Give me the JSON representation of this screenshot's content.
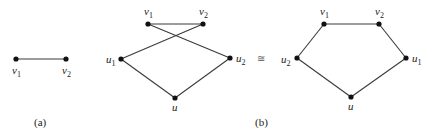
{
  "panels": [
    {
      "caption": "(a)",
      "nodes": [
        {
          "id": "v1",
          "base": "v",
          "sub": "1"
        },
        {
          "id": "v2",
          "base": "v",
          "sub": "2"
        }
      ],
      "edges": [
        [
          "v1",
          "v2"
        ]
      ]
    },
    {
      "caption": "(b)",
      "left_graph": {
        "nodes": [
          {
            "id": "v1",
            "base": "v",
            "sub": "1"
          },
          {
            "id": "v2",
            "base": "v",
            "sub": "2"
          },
          {
            "id": "u1",
            "base": "u",
            "sub": "1"
          },
          {
            "id": "u2",
            "base": "u",
            "sub": "2"
          },
          {
            "id": "u",
            "base": "u",
            "sub": ""
          }
        ],
        "edges": [
          [
            "v1",
            "v2"
          ],
          [
            "v1",
            "u2"
          ],
          [
            "v2",
            "u1"
          ],
          [
            "u1",
            "u"
          ],
          [
            "u2",
            "u"
          ]
        ]
      },
      "relation_symbol": "≅",
      "right_graph": {
        "nodes": [
          {
            "id": "v1",
            "base": "v",
            "sub": "1"
          },
          {
            "id": "v2",
            "base": "v",
            "sub": "2"
          },
          {
            "id": "u1",
            "base": "u",
            "sub": "1"
          },
          {
            "id": "u2",
            "base": "u",
            "sub": "2"
          },
          {
            "id": "u",
            "base": "u",
            "sub": ""
          }
        ],
        "edges": [
          [
            "v1",
            "v2"
          ],
          [
            "v2",
            "u1"
          ],
          [
            "u1",
            "u"
          ],
          [
            "u",
            "u2"
          ],
          [
            "u2",
            "v1"
          ]
        ]
      }
    }
  ]
}
